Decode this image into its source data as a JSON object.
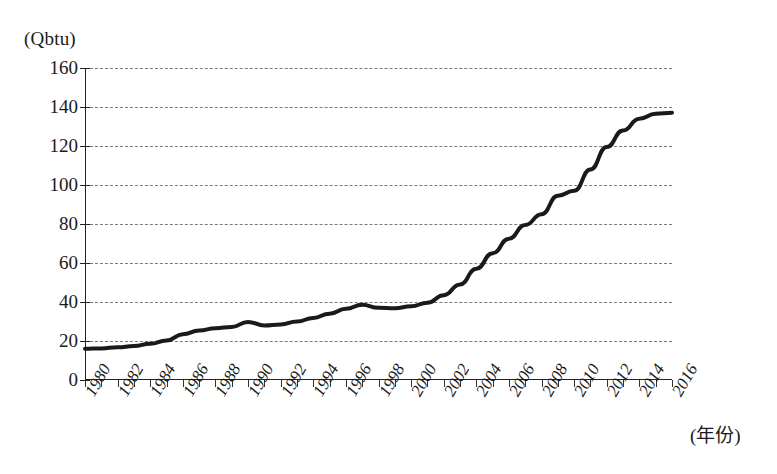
{
  "figure": {
    "unit_label": "(Qbtu)",
    "x_axis_title": "(年份)"
  },
  "chart_data": {
    "type": "line",
    "title": "",
    "subtitle": "",
    "xlabel": "(年份)",
    "ylabel": "(Qbtu)",
    "xlim": [
      1980,
      2016
    ],
    "ylim": [
      0,
      160
    ],
    "ytick_step": 20,
    "xtick_step": 2,
    "x_minor_tick_step": 1,
    "grid": "horizontal-dashed",
    "legend": "none",
    "line_color": "#1a1a1a",
    "line_width": 4,
    "ytick_labels": [
      "0",
      "20",
      "40",
      "60",
      "80",
      "100",
      "120",
      "140",
      "160"
    ],
    "ytick_values": [
      0,
      20,
      40,
      60,
      80,
      100,
      120,
      140,
      160
    ],
    "xtick_labels": [
      "1980",
      "1982",
      "1984",
      "1986",
      "1988",
      "1990",
      "1992",
      "1994",
      "1996",
      "1998",
      "2000",
      "2002",
      "2004",
      "2006",
      "2008",
      "2010",
      "2012",
      "2014",
      "2016"
    ],
    "xtick_values": [
      1980,
      1982,
      1984,
      1986,
      1988,
      1990,
      1992,
      1994,
      1996,
      1998,
      2000,
      2002,
      2004,
      2006,
      2008,
      2010,
      2012,
      2014,
      2016
    ],
    "series": [
      {
        "name": "Energy consumption",
        "x": [
          1980,
          1981,
          1982,
          1983,
          1984,
          1985,
          1986,
          1987,
          1988,
          1989,
          1990,
          1991,
          1992,
          1993,
          1994,
          1995,
          1996,
          1997,
          1998,
          1999,
          2000,
          2001,
          2002,
          2003,
          2004,
          2005,
          2006,
          2007,
          2008,
          2009,
          2010,
          2011,
          2012,
          2013,
          2014,
          2015,
          2016
        ],
        "values": [
          16.0,
          16.2,
          16.8,
          17.4,
          18.6,
          20.3,
          23.5,
          25.4,
          26.6,
          27.2,
          29.8,
          28.0,
          28.5,
          30.0,
          31.8,
          34.0,
          36.5,
          38.6,
          37.0,
          36.8,
          37.8,
          39.6,
          43.5,
          49.0,
          57.0,
          65.0,
          72.5,
          79.5,
          85.0,
          94.5,
          97.0,
          108.0,
          119.5,
          128.0,
          134.0,
          136.5,
          137.0
        ]
      }
    ]
  }
}
